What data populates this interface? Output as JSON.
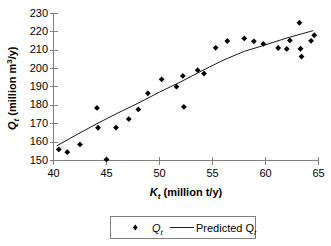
{
  "figure": {
    "name": "scatter-with-regression",
    "background": "#ffffff",
    "axis_color": "#808080",
    "marker_color": "#000000",
    "line_color": "#1a1a1a"
  },
  "axes": {
    "y_title_main": "Q",
    "y_title_sub": "t",
    "y_title_rest_a": " (million m",
    "y_title_sup": "3",
    "y_title_rest_b": "/y)",
    "x_title_main": "K",
    "x_title_sub": "t",
    "x_title_rest": " (million t/y)",
    "y_ticks": [
      "150",
      "160",
      "170",
      "180",
      "190",
      "200",
      "210",
      "220",
      "230"
    ],
    "x_ticks": [
      "40",
      "45",
      "50",
      "55",
      "60",
      "65"
    ]
  },
  "legend": {
    "series_label_main": "Q",
    "series_label_sub": "t",
    "line_label_main": "Predicted Q",
    "line_label_sub": "t",
    "marker_symbol": "diamond"
  },
  "chart_data": {
    "type": "scatter",
    "title": "",
    "xlabel": "Kt (million t/y)",
    "ylabel": "Qt (million m3/y)",
    "xlim": [
      40,
      65
    ],
    "ylim": [
      150,
      230
    ],
    "xticks": [
      40,
      45,
      50,
      55,
      60,
      65
    ],
    "yticks": [
      150,
      160,
      170,
      180,
      190,
      200,
      210,
      220,
      230
    ],
    "grid": false,
    "legend_position": "bottom-center",
    "series": [
      {
        "name": "Qt",
        "type": "scatter",
        "marker": "diamond",
        "points": [
          [
            40.5,
            156.0
          ],
          [
            41.3,
            154.5
          ],
          [
            42.5,
            158.7
          ],
          [
            44.1,
            178.4
          ],
          [
            44.2,
            167.7
          ],
          [
            45.0,
            150.6
          ],
          [
            45.9,
            167.8
          ],
          [
            47.1,
            172.4
          ],
          [
            48.0,
            177.6
          ],
          [
            48.9,
            186.3
          ],
          [
            50.2,
            193.9
          ],
          [
            51.6,
            189.9
          ],
          [
            52.2,
            195.7
          ],
          [
            52.3,
            179.0
          ],
          [
            53.6,
            198.8
          ],
          [
            54.2,
            197.0
          ],
          [
            55.3,
            210.9
          ],
          [
            56.4,
            214.6
          ],
          [
            58.0,
            216.0
          ],
          [
            58.9,
            214.4
          ],
          [
            59.8,
            213.0
          ],
          [
            61.2,
            210.8
          ],
          [
            62.0,
            210.3
          ],
          [
            62.3,
            214.9
          ],
          [
            63.2,
            224.4
          ],
          [
            63.3,
            210.4
          ],
          [
            63.4,
            206.2
          ],
          [
            64.3,
            214.7
          ],
          [
            64.6,
            217.7
          ]
        ]
      },
      {
        "name": "Predicted Qt",
        "type": "line",
        "points": [
          [
            40.3,
            157.9
          ],
          [
            42.2,
            164.0
          ],
          [
            44.2,
            170.2
          ],
          [
            46.0,
            175.5
          ],
          [
            48.0,
            181.0
          ],
          [
            50.0,
            187.0
          ],
          [
            52.0,
            192.5
          ],
          [
            54.0,
            198.5
          ],
          [
            56.0,
            204.2
          ],
          [
            58.0,
            209.0
          ],
          [
            60.0,
            212.5
          ],
          [
            62.0,
            216.2
          ],
          [
            64.5,
            220.2
          ]
        ]
      }
    ]
  }
}
